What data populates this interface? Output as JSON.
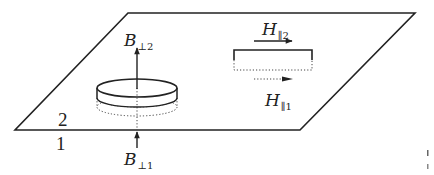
{
  "diagram": {
    "type": "interface-boundary-conditions",
    "regions": {
      "upper": "2",
      "lower": "1"
    },
    "labels": {
      "b_perp_2": {
        "symbol": "B",
        "subscript": "⊥2"
      },
      "b_perp_1": {
        "symbol": "B",
        "subscript": "⊥1"
      },
      "h_par_2": {
        "symbol": "H",
        "subscript": "∥2"
      },
      "h_par_1": {
        "symbol": "H",
        "subscript": "∥1"
      }
    },
    "elements": [
      {
        "name": "interface-plane",
        "shape": "parallelogram"
      },
      {
        "name": "gaussian-pillbox",
        "shape": "cylinder",
        "crosses": "interface"
      },
      {
        "name": "amperian-loop",
        "shape": "rectangle",
        "top": "solid",
        "bottom": "dotted"
      },
      {
        "name": "b-perp-2-arrow",
        "direction": "up",
        "style": "solid"
      },
      {
        "name": "b-perp-1-arrow",
        "direction": "up",
        "style": "solid"
      },
      {
        "name": "h-par-2-arrow",
        "direction": "right",
        "style": "solid"
      },
      {
        "name": "h-par-1-arrow",
        "direction": "right",
        "style": "dotted"
      }
    ],
    "colors": {
      "stroke": "#222222",
      "background": "#ffffff"
    }
  }
}
